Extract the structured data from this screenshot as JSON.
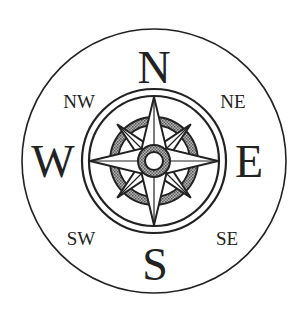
{
  "figure": {
    "width": 303,
    "height": 321,
    "center": [
      154,
      161
    ],
    "colors": {
      "background": "#ffffff",
      "stroke": "#222222",
      "shade": "#8a8a8a",
      "fill": "#ffffff"
    }
  },
  "labels": {
    "cardinal": {
      "N": {
        "text": "N",
        "x": 154,
        "y": 83
      },
      "S": {
        "text": "S",
        "x": 155,
        "y": 280
      },
      "W": {
        "text": "W",
        "x": 53,
        "y": 177
      },
      "E": {
        "text": "E",
        "x": 249,
        "y": 177
      }
    },
    "intercardinal": {
      "NW": {
        "text": "NW",
        "x": 79,
        "y": 108
      },
      "NE": {
        "text": "NE",
        "x": 233,
        "y": 108
      },
      "SW": {
        "text": "SW",
        "x": 81,
        "y": 245
      },
      "SE": {
        "text": "SE",
        "x": 227,
        "y": 245
      }
    }
  },
  "geometry": {
    "outer_circle_r": 132,
    "ring_outer_r": 72,
    "ring_inner_r": 65,
    "cardinal_point_len": 64,
    "cardinal_point_halfwidth": 13,
    "diagonal_point_len": 52,
    "diagonal_point_halfwidth": 9,
    "shade_arc_outer_r": 44,
    "shade_arc_inner_r": 36,
    "hub_outer_r": 16,
    "hub_inner_r": 9
  }
}
